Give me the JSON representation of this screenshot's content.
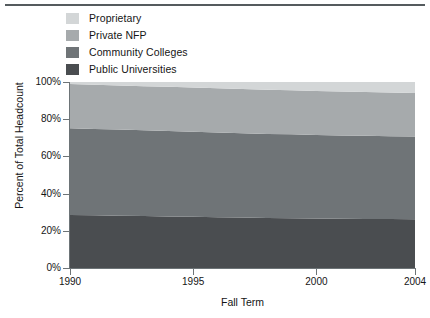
{
  "chart_data": {
    "type": "area",
    "stacked": true,
    "normalized": true,
    "title": "",
    "xlabel": "Fall Term",
    "ylabel": "Percent of Total Headcount",
    "x": [
      1990,
      1991,
      1992,
      1993,
      1994,
      1995,
      1996,
      1997,
      1998,
      1999,
      2000,
      2001,
      2002,
      2003,
      2004
    ],
    "xlim": [
      1990,
      2004
    ],
    "ylim": [
      0,
      100
    ],
    "xticks": [
      1990,
      1995,
      2000,
      2004
    ],
    "xtick_labels": [
      "1990",
      "1995",
      "2000",
      "2004"
    ],
    "yticks": [
      0,
      20,
      40,
      60,
      80,
      100
    ],
    "ytick_labels": [
      "0%",
      "20%",
      "40%",
      "60%",
      "80%",
      "100%"
    ],
    "grid": false,
    "legend_position": "top-left",
    "stack_order_bottom_to_top": [
      "Public Universities",
      "Community Colleges",
      "Private NFP",
      "Proprietary"
    ],
    "series": [
      {
        "name": "Public Universities",
        "color": "#4a4d50",
        "values": [
          28.5,
          28.3,
          28.1,
          27.9,
          27.7,
          27.5,
          27.3,
          27.1,
          26.9,
          26.8,
          26.6,
          26.5,
          26.4,
          26.3,
          26.2
        ]
      },
      {
        "name": "Community Colleges",
        "color": "#6f7477",
        "values": [
          46.6,
          46.4,
          46.3,
          46.1,
          46.0,
          45.8,
          45.6,
          45.4,
          45.2,
          45.1,
          44.9,
          44.8,
          44.7,
          44.6,
          44.5
        ]
      },
      {
        "name": "Private NFP",
        "color": "#a6aaac",
        "values": [
          23.8,
          23.8,
          23.7,
          23.7,
          23.7,
          23.7,
          23.7,
          23.7,
          23.7,
          23.6,
          23.6,
          23.6,
          23.5,
          23.5,
          23.4
        ]
      },
      {
        "name": "Proprietary",
        "color": "#d3d6d7",
        "values": [
          1.1,
          1.5,
          1.9,
          2.3,
          2.6,
          3.0,
          3.4,
          3.8,
          4.2,
          4.5,
          4.9,
          5.1,
          5.4,
          5.6,
          5.9
        ]
      }
    ]
  },
  "legend": {
    "items": [
      {
        "label": "Proprietary",
        "color": "#d3d6d7"
      },
      {
        "label": "Private NFP",
        "color": "#a6aaac"
      },
      {
        "label": "Community Colleges",
        "color": "#6f7477"
      },
      {
        "label": "Public Universities",
        "color": "#4a4d50"
      }
    ]
  },
  "axes": {
    "y_title": "Percent of Total Headcount",
    "x_title": "Fall Term",
    "y_tick_labels": [
      "100%",
      "80%",
      "60%",
      "40%",
      "20%",
      "0%"
    ],
    "x_tick_labels": [
      "1990",
      "1995",
      "2000",
      "2004"
    ]
  },
  "colors": {
    "axis": "#6d7477",
    "rule": "#555b5e",
    "text": "#151515",
    "background": "#ffffff"
  }
}
